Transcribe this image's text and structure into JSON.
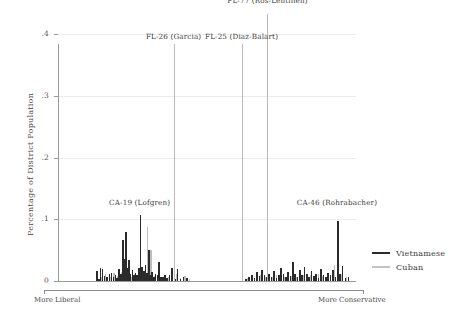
{
  "chart_data": {
    "type": "bar",
    "title": "",
    "xlabel": "",
    "ylabel": "Percentage of District Population",
    "ylim": [
      0,
      0.42
    ],
    "yticks": [
      0,
      0.1,
      0.2,
      0.3,
      0.4
    ],
    "ytick_labels": [
      "0",
      ".1",
      ".2",
      ".3",
      ".4"
    ],
    "xlim": [
      0,
      1
    ],
    "grid": true,
    "legend_position": "right",
    "x_axis_direction_left": "More Liberal",
    "x_axis_direction_right": "More Conservative",
    "series": [
      {
        "name": "Vietnamese",
        "color": "#2b2b2b",
        "points": [
          [
            0.128,
            0.016
          ],
          [
            0.134,
            0.004
          ],
          [
            0.14,
            0.021
          ],
          [
            0.147,
            0.02
          ],
          [
            0.154,
            0.008
          ],
          [
            0.161,
            0.006
          ],
          [
            0.17,
            0.011
          ],
          [
            0.177,
            0.013
          ],
          [
            0.184,
            0.007
          ],
          [
            0.19,
            0.01
          ],
          [
            0.196,
            0.005
          ],
          [
            0.203,
            0.019
          ],
          [
            0.209,
            0.012
          ],
          [
            0.216,
            0.067
          ],
          [
            0.221,
            0.036
          ],
          [
            0.226,
            0.08
          ],
          [
            0.231,
            0.021
          ],
          [
            0.236,
            0.034
          ],
          [
            0.241,
            0.012
          ],
          [
            0.247,
            0.018
          ],
          [
            0.252,
            0.009
          ],
          [
            0.258,
            0.013
          ],
          [
            0.263,
            0.01
          ],
          [
            0.269,
            0.021
          ],
          [
            0.274,
            0.107
          ],
          [
            0.28,
            0.023
          ],
          [
            0.285,
            0.016
          ],
          [
            0.291,
            0.026
          ],
          [
            0.296,
            0.013
          ],
          [
            0.302,
            0.05
          ],
          [
            0.308,
            0.01
          ],
          [
            0.313,
            0.014
          ],
          [
            0.319,
            0.007
          ],
          [
            0.325,
            0.012
          ],
          [
            0.331,
            0.009
          ],
          [
            0.337,
            0.031
          ],
          [
            0.343,
            0.007
          ],
          [
            0.349,
            0.006
          ],
          [
            0.356,
            0.01
          ],
          [
            0.363,
            0.005
          ],
          [
            0.372,
            0.009
          ],
          [
            0.38,
            0.021
          ],
          [
            0.39,
            0.004
          ],
          [
            0.399,
            0.02
          ],
          [
            0.409,
            0.003
          ],
          [
            0.419,
            0.006
          ],
          [
            0.43,
            0.005
          ],
          [
            0.628,
            0.004
          ],
          [
            0.638,
            0.006
          ],
          [
            0.648,
            0.009
          ],
          [
            0.657,
            0.005
          ],
          [
            0.666,
            0.014
          ],
          [
            0.674,
            0.008
          ],
          [
            0.682,
            0.018
          ],
          [
            0.69,
            0.01
          ],
          [
            0.698,
            0.006
          ],
          [
            0.706,
            0.012
          ],
          [
            0.714,
            0.007
          ],
          [
            0.722,
            0.016
          ],
          [
            0.73,
            0.005
          ],
          [
            0.738,
            0.009
          ],
          [
            0.746,
            0.021
          ],
          [
            0.754,
            0.011
          ],
          [
            0.762,
            0.006
          ],
          [
            0.77,
            0.014
          ],
          [
            0.778,
            0.008
          ],
          [
            0.786,
            0.031
          ],
          [
            0.793,
            0.012
          ],
          [
            0.801,
            0.007
          ],
          [
            0.809,
            0.018
          ],
          [
            0.817,
            0.009
          ],
          [
            0.825,
            0.022
          ],
          [
            0.833,
            0.011
          ],
          [
            0.84,
            0.006
          ],
          [
            0.848,
            0.016
          ],
          [
            0.856,
            0.008
          ],
          [
            0.864,
            0.012
          ],
          [
            0.872,
            0.005
          ],
          [
            0.88,
            0.019
          ],
          [
            0.888,
            0.01
          ],
          [
            0.896,
            0.007
          ],
          [
            0.904,
            0.013
          ],
          [
            0.912,
            0.009
          ],
          [
            0.92,
            0.018
          ],
          [
            0.928,
            0.006
          ],
          [
            0.936,
            0.098
          ],
          [
            0.944,
            0.011
          ],
          [
            0.952,
            0.024
          ],
          [
            0.962,
            0.005
          ],
          [
            0.972,
            0.007
          ]
        ]
      },
      {
        "name": "Cuban",
        "color": "#bdbdbd",
        "points": [
          [
            0.13,
            0.009
          ],
          [
            0.143,
            0.006
          ],
          [
            0.157,
            0.011
          ],
          [
            0.172,
            0.007
          ],
          [
            0.186,
            0.013
          ],
          [
            0.199,
            0.008
          ],
          [
            0.212,
            0.015
          ],
          [
            0.224,
            0.041
          ],
          [
            0.234,
            0.01
          ],
          [
            0.244,
            0.007
          ],
          [
            0.256,
            0.012
          ],
          [
            0.266,
            0.009
          ],
          [
            0.277,
            0.006
          ],
          [
            0.288,
            0.011
          ],
          [
            0.299,
            0.088
          ],
          [
            0.31,
            0.051
          ],
          [
            0.322,
            0.008
          ],
          [
            0.334,
            0.013
          ],
          [
            0.346,
            0.007
          ],
          [
            0.358,
            0.01
          ],
          [
            0.37,
            0.006
          ],
          [
            0.383,
            0.009
          ],
          [
            0.396,
            0.012
          ],
          [
            0.41,
            0.005
          ],
          [
            0.424,
            0.008
          ],
          [
            0.44,
            0.004
          ],
          [
            0.634,
            0.005
          ],
          [
            0.65,
            0.008
          ],
          [
            0.664,
            0.006
          ],
          [
            0.678,
            0.01
          ],
          [
            0.692,
            0.007
          ],
          [
            0.705,
            0.012
          ],
          [
            0.718,
            0.006
          ],
          [
            0.732,
            0.009
          ],
          [
            0.744,
            0.014
          ],
          [
            0.757,
            0.007
          ],
          [
            0.77,
            0.011
          ],
          [
            0.782,
            0.008
          ],
          [
            0.796,
            0.006
          ],
          [
            0.808,
            0.013
          ],
          [
            0.821,
            0.009
          ],
          [
            0.834,
            0.007
          ],
          [
            0.847,
            0.01
          ],
          [
            0.86,
            0.006
          ],
          [
            0.873,
            0.012
          ],
          [
            0.886,
            0.008
          ],
          [
            0.899,
            0.005
          ],
          [
            0.912,
            0.009
          ],
          [
            0.925,
            0.026
          ],
          [
            0.938,
            0.007
          ],
          [
            0.95,
            0.011
          ],
          [
            0.965,
            0.006
          ]
        ]
      }
    ],
    "annotations": [
      {
        "id": "fl-77",
        "label": "FL-77 (Ros-Lehtinen)",
        "x": 0.703,
        "value": 0.44,
        "label_y": 0.455,
        "label_anchor": "center"
      },
      {
        "id": "fl-26",
        "label": "FL-26 (Garcia)",
        "x": 0.388,
        "value": 0.385,
        "label_y": 0.398,
        "label_anchor": "center"
      },
      {
        "id": "fl-25",
        "label": "FL-25 (Diaz-Balart)",
        "x": 0.616,
        "value": 0.385,
        "label_y": 0.398,
        "label_anchor": "center"
      },
      {
        "id": "ca-19",
        "label": "CA-19 (Lofgren)",
        "x": 0.274,
        "value": null,
        "label_y": 0.128,
        "label_anchor": "center"
      },
      {
        "id": "ca-46",
        "label": "CA-46 (Rohrabacher)",
        "x": 0.936,
        "value": null,
        "label_y": 0.128,
        "label_anchor": "center"
      }
    ]
  },
  "legend": {
    "items": [
      {
        "label": "Vietnamese",
        "color": "#2b2b2b"
      },
      {
        "label": "Cuban",
        "color": "#c3c3c3"
      }
    ]
  }
}
